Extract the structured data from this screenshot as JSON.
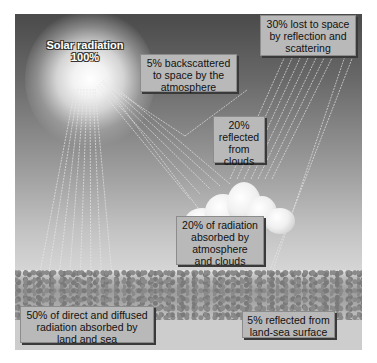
{
  "diagram": {
    "source": {
      "label": "Solar radiation",
      "value": "100%"
    },
    "labels": {
      "backscattered": "5% backscattered to space by the atmosphere",
      "lost": "30% lost to space by reflection and scattering",
      "clouds_reflected": "20% reflected from clouds",
      "absorbed_atmosphere": "20% of radiation absorbed by atmosphere and clouds",
      "absorbed_land_sea": "50% of direct and diffused radiation absorbed by land and sea",
      "surface_reflected": "5% reflected from land-sea surface"
    },
    "lines": {
      "sun_label_1": "Solar radiation",
      "sun_label_2": "100%",
      "backscatter_1": "5% backscattered",
      "backscatter_2": "to space by the",
      "backscatter_3": "atmosphere",
      "lost_1": "30% lost to space",
      "lost_2": "by reflection and",
      "lost_3": "scattering",
      "cloudref_1": "20%",
      "cloudref_2": "reflected",
      "cloudref_3": "from",
      "cloudref_4": "clouds",
      "absatm_1": "20% of radiation",
      "absatm_2": "absorbed by",
      "absatm_3": "atmosphere",
      "absatm_4": "and clouds",
      "absland_1": "50% of direct and diffused",
      "absland_2": "radiation absorbed by",
      "absland_3": "land and sea",
      "surfref_1": "5% reflected from",
      "surfref_2": "land-sea surface"
    },
    "colors": {
      "sky_top": "#4a4a4a",
      "sky_bottom": "#d8d8d8",
      "box_fill": "#b9b9b9",
      "ray": "#eeeeee"
    }
  }
}
